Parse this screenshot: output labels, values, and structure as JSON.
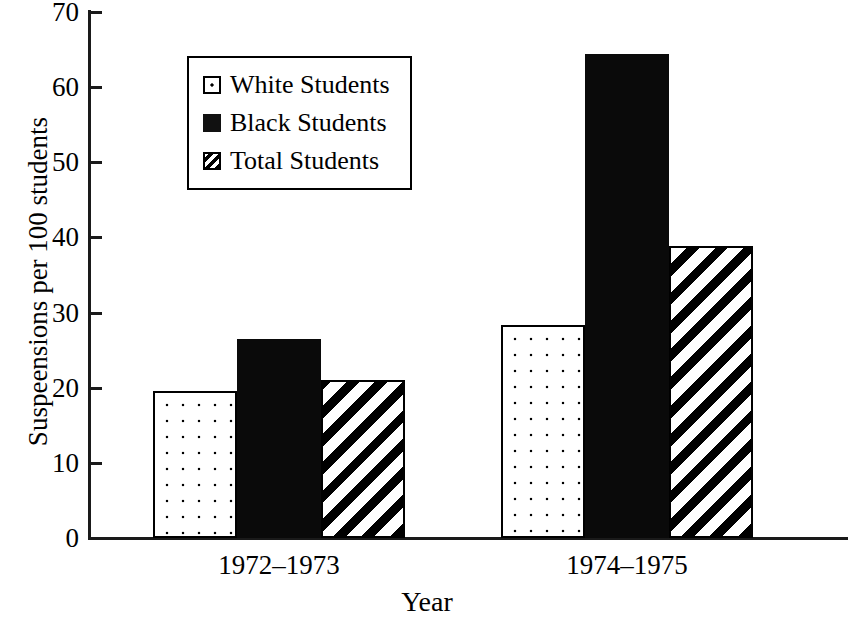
{
  "chart_data": {
    "type": "bar",
    "title": "",
    "xlabel": "Year",
    "ylabel": "Suspeensions per 100 students",
    "categories": [
      "1972–1973",
      "1974–1975"
    ],
    "series": [
      {
        "name": "White Students",
        "values": [
          19.6,
          28.4
        ],
        "pattern": "dotted",
        "color": "#ffffff"
      },
      {
        "name": "Black Students",
        "values": [
          26.5,
          64.4
        ],
        "pattern": "solid",
        "color": "#000000"
      },
      {
        "name": "Total Students",
        "values": [
          21.0,
          38.8
        ],
        "pattern": "diagonal-hatch",
        "color": "#ffffff"
      }
    ],
    "ylim": [
      0,
      70
    ],
    "y_ticks": [
      0,
      10,
      20,
      30,
      40,
      50,
      60,
      70
    ],
    "y_tick_labels": [
      "0",
      "10",
      "20",
      "30",
      "40",
      "50",
      "60",
      "70"
    ],
    "grid": false,
    "legend_position": "upper-left-inset"
  },
  "legend": {
    "items": [
      {
        "label": "White Students",
        "swatch": "white-dotted-swatch"
      },
      {
        "label": "Black Students",
        "swatch": "black-solid-swatch"
      },
      {
        "label": "Total Students",
        "swatch": "hatched-swatch"
      }
    ]
  },
  "axes": {
    "y_title": "Suspeensions per 100 students",
    "x_title": "Year"
  }
}
